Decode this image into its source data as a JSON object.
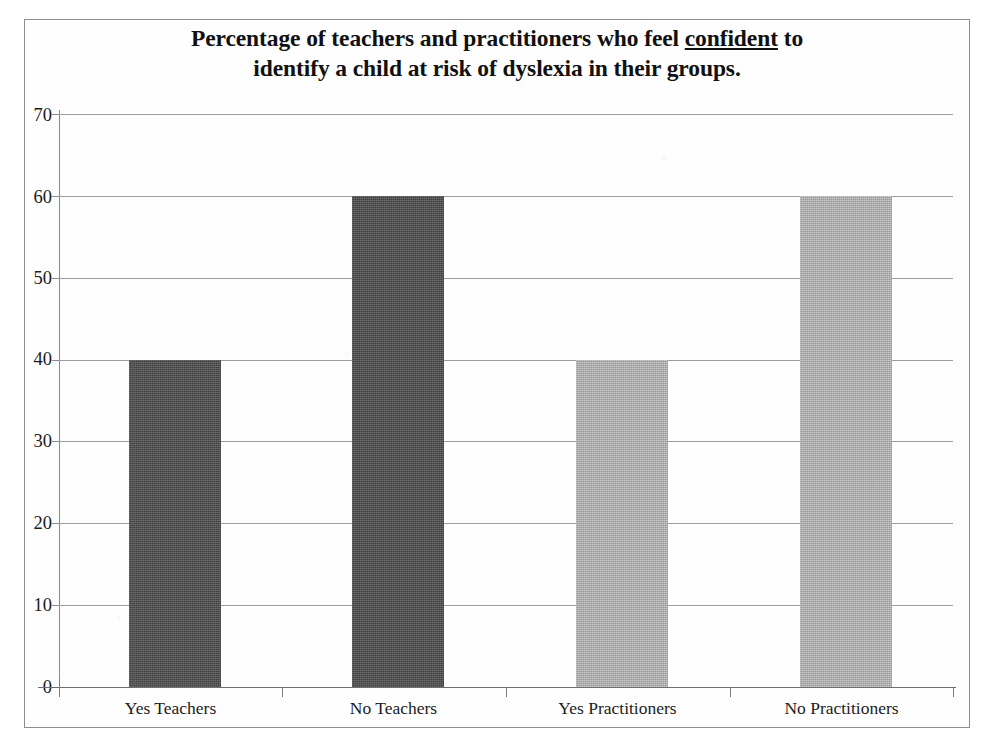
{
  "chart_data": {
    "type": "bar",
    "title_line1_before": "Percentage of teachers and practitioners who feel ",
    "title_line1_underlined": "confident",
    "title_line1_after": " to",
    "title_line2": "identify a child at risk of dyslexia in their groups.",
    "title": "Percentage of teachers and practitioners who feel confident to identify a child at risk of dyslexia in their groups.",
    "categories": [
      "Yes Teachers",
      "No Teachers",
      "Yes Practitioners",
      "No Practitioners"
    ],
    "values": [
      40,
      60,
      40,
      60
    ],
    "bar_colors": [
      "#4d4d4d",
      "#4d4d4d",
      "#b4b4b4",
      "#b4b4b4"
    ],
    "xlabel": "",
    "ylabel": "",
    "ylim": [
      0,
      70
    ],
    "ytick_step": 10,
    "yticks": [
      0,
      10,
      20,
      30,
      40,
      50,
      60,
      70
    ],
    "ytick_labels": [
      "0",
      "10",
      "20",
      "30",
      "40",
      "50",
      "60",
      "70"
    ],
    "grid": "horizontal",
    "legend": "none",
    "series": [
      {
        "name": "Percentage",
        "values": [
          40,
          60,
          40,
          60
        ]
      }
    ],
    "annotations": []
  },
  "colors": {
    "dark_bar": "#4d4d4d",
    "light_bar": "#b4b4b4",
    "gridline": "#9d9d9d",
    "axis": "#6d6d6d",
    "frame": "#8e8e8e",
    "text": "#1b1b1b",
    "background": "#ffffff"
  }
}
